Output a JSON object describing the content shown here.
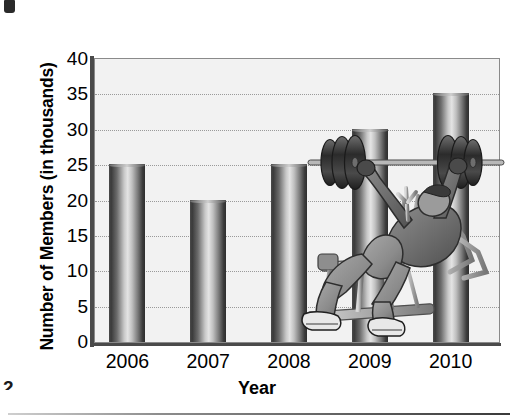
{
  "page": {
    "page_number": "2",
    "corner_mark": "black-square-mark"
  },
  "chart_data": {
    "type": "bar",
    "title": "",
    "categories": [
      "2006",
      "2007",
      "2008",
      "2009",
      "2010"
    ],
    "values": [
      25,
      20,
      25,
      30,
      35
    ],
    "xlabel": "Year",
    "ylabel": "Number of Members (in thousands)",
    "ylim": [
      0,
      40
    ],
    "ytick_step": 5,
    "yticks": [
      "0",
      "5",
      "10",
      "15",
      "20",
      "25",
      "30",
      "35",
      "40"
    ],
    "grid": "horizontal-dotted",
    "legend": "none",
    "series": [
      {
        "name": "Number of Members",
        "values": [
          25,
          20,
          25,
          30,
          35
        ]
      }
    ],
    "annotations": [
      {
        "name": "weightlifter-illustration",
        "description": "Person doing an incline bench press with a barbell, overlapping the 2010 bar"
      }
    ],
    "style": {
      "bar_shape": "cylinder",
      "bar_fill_dark": "#3a3a3a",
      "bar_fill_light": "#e4e4e4",
      "plot_background": "#f2f2f2",
      "gridline_color": "#9a9a9a",
      "axis_color": "#4a4a4a"
    }
  }
}
